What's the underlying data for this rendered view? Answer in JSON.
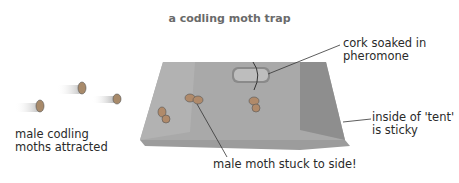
{
  "title": "a codling moth trap",
  "labels": {
    "cork": [
      "cork soaked in",
      "pheromone"
    ],
    "attracted": [
      "male codling",
      "moths attracted"
    ],
    "sticky": [
      "inside of 'tent'",
      "is sticky"
    ],
    "stuck": "male moth stuck to side!"
  },
  "colors": {
    "trap_face": "#a8a8a8",
    "trap_side": "#8f8f8f",
    "trap_bottom": "#9a9a9a",
    "text": "#2a2a2a",
    "title": "#6a6a6a"
  }
}
